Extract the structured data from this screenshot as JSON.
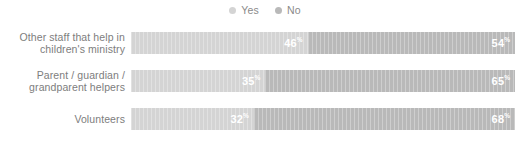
{
  "chart_data": {
    "type": "bar",
    "subtype": "stacked-horizontal-100-percent",
    "title": "",
    "subtitle": "",
    "xlabel": "",
    "ylabel": "",
    "xlim": [
      0,
      100
    ],
    "grid": false,
    "legend_position": "top-center",
    "categories": [
      "Other staff that help in children's ministry",
      "Parent / guardian / grandparent helpers",
      "Volunteers"
    ],
    "series": [
      {
        "name": "Yes",
        "color": "#d4d4d4",
        "values": [
          46,
          35,
          32
        ]
      },
      {
        "name": "No",
        "color": "#b9b9b9",
        "values": [
          54,
          65,
          68
        ]
      }
    ],
    "value_suffix": "%"
  },
  "legend": {
    "items": [
      {
        "label": "Yes",
        "color": "#d4d4d4",
        "marker": "circle-dot-icon"
      },
      {
        "label": "No",
        "color": "#b9b9b9",
        "marker": "circle-dot-icon"
      }
    ]
  },
  "rows": [
    {
      "label_lines": [
        "Other staff that help in",
        "children's ministry"
      ],
      "segments": [
        {
          "series": "Yes",
          "value": 46,
          "value_text": "46",
          "suffix": "%",
          "color": "#d4d4d4"
        },
        {
          "series": "No",
          "value": 54,
          "value_text": "54",
          "suffix": "%",
          "color": "#b9b9b9"
        }
      ]
    },
    {
      "label_lines": [
        "Parent / guardian /",
        "grandparent helpers"
      ],
      "segments": [
        {
          "series": "Yes",
          "value": 35,
          "value_text": "35",
          "suffix": "%",
          "color": "#d4d4d4"
        },
        {
          "series": "No",
          "value": 65,
          "value_text": "65",
          "suffix": "%",
          "color": "#b9b9b9"
        }
      ]
    },
    {
      "label_lines": [
        "Volunteers"
      ],
      "segments": [
        {
          "series": "Yes",
          "value": 32,
          "value_text": "32",
          "suffix": "%",
          "color": "#d4d4d4"
        },
        {
          "series": "No",
          "value": 68,
          "value_text": "68",
          "suffix": "%",
          "color": "#b9b9b9"
        }
      ]
    }
  ],
  "colors": {
    "yes": "#d4d4d4",
    "no": "#b9b9b9",
    "label_text": "#7d7d7d",
    "legend_text": "#8a8a8a",
    "value_text": "#ffffff",
    "background": "#ffffff"
  }
}
